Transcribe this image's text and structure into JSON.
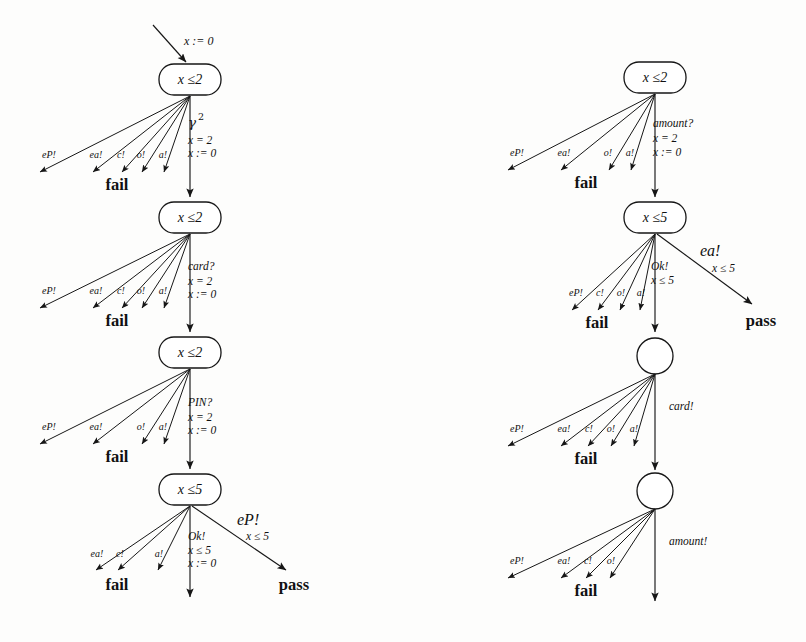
{
  "figure": {
    "background": "#fdfdfc",
    "ink": "#111111"
  },
  "labels": {
    "fail": "fail",
    "pass": "pass",
    "init_assign": "x := 0",
    "gamma_base": "γ",
    "gamma_exp": "2",
    "guard_x_eq_2": "x = 2",
    "assign_x_0": "x := 0",
    "guard_x_le_5": "x ≤ 5",
    "node_x_le_2": "x ≤2",
    "node_x_le_5": "x ≤5",
    "action_card_q": "card?",
    "action_PIN_q": "PIN?",
    "action_Ok": "Ok!",
    "action_eP": "eP!",
    "action_ea": "ea!",
    "action_amount_q": "amount?",
    "action_card_b": "card!",
    "action_amount_b": "amount!",
    "fan_eP": "eP!",
    "fan_ea": "ea!",
    "fan_c": "c!",
    "fan_o": "o!",
    "fan_a": "a!"
  },
  "left_tree": {
    "name": "left-test-tree",
    "initial_edge": {
      "label": "x := 0"
    },
    "nodes": [
      {
        "id": "L1",
        "shape": "rounded-rect",
        "label": "x ≤2",
        "cx": 190,
        "cy": 80
      },
      {
        "id": "L2",
        "shape": "rounded-rect",
        "label": "x ≤2",
        "cx": 190,
        "cy": 218
      },
      {
        "id": "L3",
        "shape": "rounded-rect",
        "label": "x ≤2",
        "cx": 190,
        "cy": 353
      },
      {
        "id": "L4",
        "shape": "rounded-rect",
        "label": "x ≤5",
        "cx": 190,
        "cy": 490
      }
    ],
    "main_transitions": [
      {
        "from": "L1",
        "to": "L2",
        "action": "γ²",
        "guard": "x = 2",
        "assign": "x := 0"
      },
      {
        "from": "L2",
        "to": "L3",
        "action": "card?",
        "guard": "x = 2",
        "assign": "x := 0"
      },
      {
        "from": "L3",
        "to": "L4",
        "action": "PIN?",
        "guard": "x = 2",
        "assign": "x := 0"
      },
      {
        "from": "L4",
        "to": "terminal",
        "action": "Ok!",
        "guard": "x ≤ 5",
        "assign": "x := 0"
      }
    ],
    "fans": [
      {
        "from": "L1",
        "target": "fail",
        "labels": [
          "eP!",
          "ea!",
          "c!",
          "o!",
          "a!"
        ]
      },
      {
        "from": "L2",
        "target": "fail",
        "labels": [
          "eP!",
          "ea!",
          "c!",
          "o!",
          "a!"
        ]
      },
      {
        "from": "L3",
        "target": "fail",
        "labels": [
          "eP!",
          "ea!",
          "o!",
          "a!"
        ]
      },
      {
        "from": "L4",
        "target": "fail",
        "labels": [
          "ea!",
          "c!",
          "a!"
        ]
      }
    ],
    "pass_edge": {
      "from": "L4",
      "action": "eP!",
      "guard": "x ≤ 5",
      "target": "pass"
    }
  },
  "right_tree": {
    "name": "right-test-tree",
    "nodes": [
      {
        "id": "R1",
        "shape": "rounded-rect",
        "label": "x ≤2",
        "cx": 655,
        "cy": 78
      },
      {
        "id": "R2",
        "shape": "rounded-rect",
        "label": "x ≤5",
        "cx": 655,
        "cy": 218
      },
      {
        "id": "R3",
        "shape": "circle",
        "label": "",
        "cx": 655,
        "cy": 356
      },
      {
        "id": "R4",
        "shape": "circle",
        "label": "",
        "cx": 655,
        "cy": 491
      }
    ],
    "main_transitions": [
      {
        "from": "R1",
        "to": "R2",
        "action": "amount?",
        "guard": "x = 2",
        "assign": "x := 0"
      },
      {
        "from": "R2",
        "to": "R3",
        "action": "Ok!",
        "guard": "x ≤ 5",
        "assign": ""
      },
      {
        "from": "R3",
        "to": "R4",
        "action": "card!",
        "guard": "",
        "assign": ""
      },
      {
        "from": "R4",
        "to": "terminal",
        "action": "amount!",
        "guard": "",
        "assign": ""
      }
    ],
    "fans": [
      {
        "from": "R1",
        "target": "fail",
        "labels": [
          "eP!",
          "ea!",
          "o!",
          "a!"
        ]
      },
      {
        "from": "R2",
        "target": "fail",
        "labels": [
          "eP!",
          "c!",
          "o!",
          "a!"
        ]
      },
      {
        "from": "R3",
        "target": "fail",
        "labels": [
          "eP!",
          "ea!",
          "c!",
          "o!",
          "a!"
        ]
      },
      {
        "from": "R4",
        "target": "fail",
        "labels": [
          "eP!",
          "ea!",
          "c!",
          "o!"
        ]
      }
    ],
    "pass_edge": {
      "from": "R2",
      "action": "ea!",
      "guard": "x ≤ 5",
      "target": "pass"
    }
  }
}
